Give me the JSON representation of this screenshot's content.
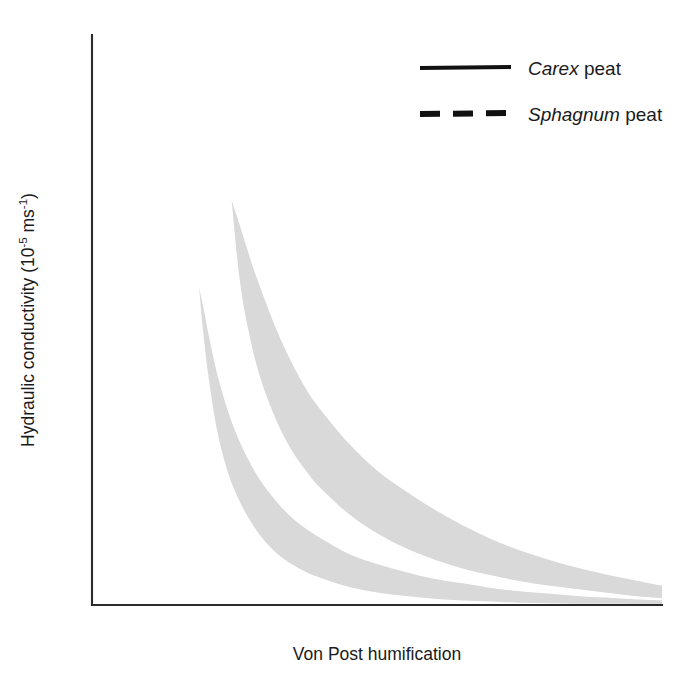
{
  "chart_data": {
    "type": "line",
    "title": "",
    "xlabel": "Von Post humification",
    "ylabel": "Hydraulic conductivity (10-5 ms-1)",
    "ylabel_parts": {
      "prefix": "Hydraulic conductivity (10",
      "exp1": "-5",
      "middle": " ms",
      "exp2": "-1",
      "suffix": ")"
    },
    "xlim": [
      0,
      10
    ],
    "ylim": [
      0,
      5
    ],
    "xticks": [
      0,
      2,
      4,
      6,
      8,
      10
    ],
    "xticklabels": [
      "0",
      "2",
      "4",
      "6",
      "8",
      "10"
    ],
    "xminorticks": [
      1,
      3,
      5,
      7,
      9
    ],
    "yticks": [
      0,
      1,
      2,
      3,
      4,
      5
    ],
    "yticklabels": [
      "0",
      "1",
      "2",
      "3",
      "4",
      "5"
    ],
    "grid": false,
    "legend_position": "top-right",
    "colors": {
      "line": "#111111",
      "band_fill": "#d9d9d9",
      "axis": "#2b2b2b"
    },
    "series": [
      {
        "name": "Carex peat",
        "genus": "Carex",
        "common": "peat",
        "style": "solid",
        "x": [
          2.2,
          2.3,
          2.45,
          2.6,
          2.8,
          3.0,
          3.25,
          3.5,
          3.75,
          4.0,
          4.5,
          5.0,
          5.5,
          6.0,
          6.5,
          7.0,
          7.5,
          8.0,
          8.5,
          9.0,
          9.5,
          10.0
        ],
        "values": [
          5.0,
          4.35,
          3.55,
          3.05,
          2.6,
          2.28,
          1.96,
          1.7,
          1.5,
          1.33,
          1.06,
          0.86,
          0.7,
          0.58,
          0.47,
          0.39,
          0.32,
          0.26,
          0.21,
          0.17,
          0.13,
          0.1
        ],
        "upper": {
          "x": [
            2.45,
            2.6,
            2.8,
            3.0,
            3.25,
            3.5,
            3.75,
            4.0,
            4.5,
            5.0,
            5.5,
            6.0,
            6.5,
            7.0,
            7.5,
            8.0,
            8.5,
            9.0,
            9.5,
            10.0
          ],
          "values": [
            3.55,
            3.32,
            3.0,
            2.72,
            2.4,
            2.13,
            1.9,
            1.72,
            1.42,
            1.18,
            1.0,
            0.84,
            0.7,
            0.58,
            0.48,
            0.4,
            0.33,
            0.27,
            0.22,
            0.17
          ]
        },
        "lower": {
          "x": [
            2.45,
            2.6,
            2.8,
            3.0,
            3.25,
            3.5,
            3.75,
            4.0,
            4.5,
            5.0,
            5.5,
            6.0,
            6.5,
            7.0,
            7.5,
            8.0,
            8.5,
            9.0,
            9.5,
            10.0
          ],
          "values": [
            3.55,
            2.82,
            2.28,
            1.92,
            1.6,
            1.36,
            1.18,
            1.03,
            0.8,
            0.63,
            0.5,
            0.4,
            0.32,
            0.26,
            0.21,
            0.17,
            0.14,
            0.11,
            0.08,
            0.06
          ]
        }
      },
      {
        "name": "Sphagnum peat",
        "genus": "Sphagnum",
        "common": "peat",
        "style": "dashed",
        "x": [
          1.78,
          1.85,
          1.95,
          2.05,
          2.2,
          2.4,
          2.6,
          2.8,
          3.0,
          3.25,
          3.5,
          3.75,
          4.0,
          4.5,
          5.0,
          5.5,
          6.0,
          6.5,
          7.0,
          7.5,
          8.0,
          8.5,
          9.0,
          9.5,
          10.0
        ],
        "values": [
          3.2,
          2.8,
          2.35,
          2.0,
          1.62,
          1.28,
          1.05,
          0.88,
          0.75,
          0.62,
          0.52,
          0.44,
          0.38,
          0.28,
          0.21,
          0.16,
          0.12,
          0.09,
          0.06,
          0.045,
          0.035,
          0.025,
          0.02,
          0.015,
          0.01
        ],
        "upper": {
          "x": [
            1.88,
            1.95,
            2.05,
            2.2,
            2.4,
            2.6,
            2.8,
            3.0,
            3.25,
            3.5,
            3.75,
            4.0,
            4.5,
            5.0,
            5.5,
            6.0,
            6.5,
            7.0,
            7.5,
            8.0,
            8.5,
            9.0,
            9.5,
            10.0
          ],
          "values": [
            2.78,
            2.62,
            2.36,
            2.02,
            1.68,
            1.42,
            1.22,
            1.06,
            0.9,
            0.77,
            0.67,
            0.59,
            0.45,
            0.36,
            0.29,
            0.23,
            0.19,
            0.15,
            0.12,
            0.1,
            0.08,
            0.065,
            0.05,
            0.04
          ]
        },
        "lower": {
          "x": [
            1.88,
            1.95,
            2.05,
            2.2,
            2.4,
            2.6,
            2.8,
            3.0,
            3.25,
            3.5,
            3.75,
            4.0,
            4.5,
            5.0,
            5.5,
            6.0,
            6.5,
            7.0,
            7.5,
            8.0,
            8.5,
            9.0,
            9.5,
            10.0
          ],
          "values": [
            2.78,
            2.4,
            1.98,
            1.52,
            1.14,
            0.9,
            0.72,
            0.58,
            0.45,
            0.36,
            0.29,
            0.24,
            0.16,
            0.11,
            0.08,
            0.055,
            0.04,
            0.03,
            0.02,
            0.015,
            0.012,
            0.01,
            0.008,
            0.005
          ]
        }
      }
    ]
  },
  "legend": {
    "entries": [
      {
        "genus": "Carex",
        "rest": " peat",
        "style": "solid"
      },
      {
        "genus": "Sphagnum",
        "rest": " peat",
        "style": "dashed"
      }
    ]
  },
  "axes": {
    "x_title": "Von Post humification",
    "y_title_prefix": "Hydraulic conductivity (10",
    "y_title_exp1": "-5",
    "y_title_mid": " ms",
    "y_title_exp2": "-1",
    "y_title_suffix": ")"
  }
}
